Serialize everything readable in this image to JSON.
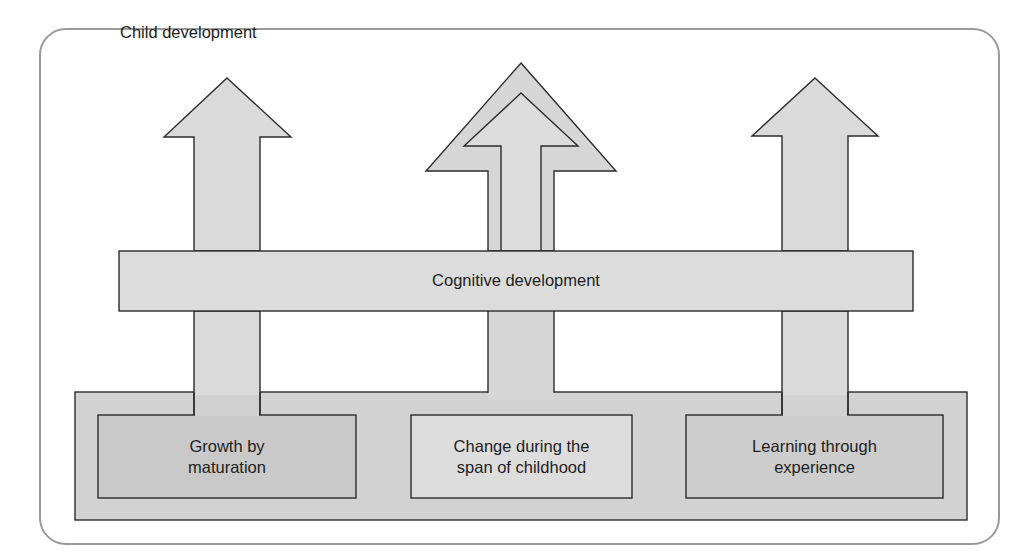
{
  "diagram": {
    "title": "Child development",
    "band_label": "Cognitive development",
    "boxes": [
      {
        "line1": "Growth by",
        "line2": "maturation"
      },
      {
        "line1": "Change during the",
        "line2": "span of childhood"
      },
      {
        "line1": "Learning through",
        "line2": "experience"
      }
    ],
    "colors": {
      "frame_stroke": "#9a9a9a",
      "outline": "#2b2b2b",
      "arrow_fill": "#dadada",
      "band_fill": "#dcdcdc",
      "base_fill": "#d2d2d2",
      "box_left_fill": "#c9c9c9",
      "box_middle_fill": "#dddddd",
      "box_right_fill": "#cdcdcd",
      "text": "#1e1e1e"
    }
  }
}
